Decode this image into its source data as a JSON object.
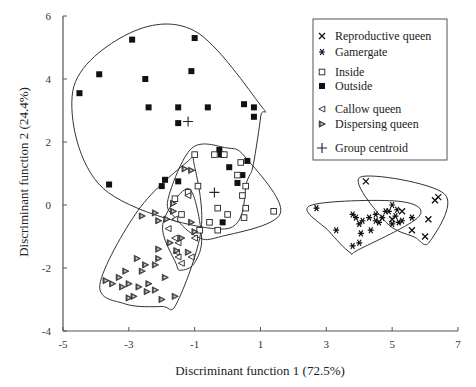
{
  "chart_data": {
    "type": "scatter",
    "title": "",
    "xlabel": "Discriminant function 1 (72.5%)",
    "ylabel": "Discriminant function 2 (24.4%)",
    "xlim": [
      -5,
      7
    ],
    "ylim": [
      -4,
      6
    ],
    "xticks": [
      -5,
      -3,
      -1,
      1,
      3,
      5,
      7
    ],
    "yticks": [
      -4,
      -2,
      0,
      2,
      4,
      6
    ],
    "grid": false,
    "legend_position": "upper right",
    "legend": [
      {
        "name": "Reproductive queen",
        "marker": "x"
      },
      {
        "name": "Gamergate",
        "marker": "asterisk"
      },
      {
        "name": "Inside",
        "marker": "open-square"
      },
      {
        "name": "Outside",
        "marker": "filled-square"
      },
      {
        "name": "Callow queen",
        "marker": "open-left-triangle"
      },
      {
        "name": "Dispersing queen",
        "marker": "filled-right-triangle"
      },
      {
        "name": "Group centroid",
        "marker": "plus"
      }
    ],
    "series": [
      {
        "name": "Outside",
        "points": [
          [
            -4.5,
            3.55
          ],
          [
            -3.9,
            4.15
          ],
          [
            -2.9,
            5.25
          ],
          [
            -2.5,
            4.0
          ],
          [
            -2.4,
            3.1
          ],
          [
            -1.5,
            3.1
          ],
          [
            -1.0,
            5.3
          ],
          [
            -1.1,
            4.25
          ],
          [
            -0.6,
            3.1
          ],
          [
            0.5,
            3.2
          ],
          [
            0.8,
            3.1
          ],
          [
            0.8,
            2.8
          ],
          [
            -1.5,
            2.6
          ],
          [
            -3.6,
            0.65
          ],
          [
            -2.0,
            0.6
          ],
          [
            -1.9,
            0.8
          ],
          [
            -1.5,
            0.75
          ],
          [
            -0.2,
            1.6
          ],
          [
            -0.25,
            1.75
          ],
          [
            0.05,
            1.2
          ],
          [
            0.45,
            0.95
          ],
          [
            0.6,
            1.4
          ],
          [
            0.3,
            0.7
          ],
          [
            -0.15,
            -0.55
          ]
        ],
        "centroid": [
          -1.2,
          2.65
        ]
      },
      {
        "name": "Inside",
        "points": [
          [
            -1.0,
            1.6
          ],
          [
            -0.4,
            1.6
          ],
          [
            -0.1,
            1.6
          ],
          [
            0.4,
            1.35
          ],
          [
            0.3,
            0.95
          ],
          [
            0.55,
            0.6
          ],
          [
            -0.9,
            0.6
          ],
          [
            -1.2,
            0.4
          ],
          [
            0.45,
            0.3
          ],
          [
            -1.6,
            0.2
          ],
          [
            -0.3,
            -0.1
          ],
          [
            -0.0,
            -0.3
          ],
          [
            0.55,
            -0.1
          ],
          [
            0.5,
            -0.4
          ],
          [
            1.4,
            -0.2
          ],
          [
            -0.55,
            -0.55
          ],
          [
            -0.85,
            -0.8
          ],
          [
            -0.3,
            -0.8
          ],
          [
            -1.4,
            -0.3
          ]
        ],
        "centroid": [
          -0.4,
          0.4
        ]
      },
      {
        "name": "Callow queen",
        "points": [
          [
            -1.2,
            0.3
          ],
          [
            -1.6,
            -0.45
          ],
          [
            -1.8,
            -0.75
          ],
          [
            -1.0,
            -1.05
          ],
          [
            -1.5,
            -1.2
          ],
          [
            -1.55,
            -1.5
          ],
          [
            -1.6,
            -1.05
          ],
          [
            -1.1,
            -1.65
          ],
          [
            -1.4,
            -1.85
          ],
          [
            -1.5,
            -1.65
          ]
        ],
        "centroid": [
          -1.35,
          -1.0
        ]
      },
      {
        "name": "Dispersing queen",
        "points": [
          [
            -1.1,
            1.1
          ],
          [
            -1.3,
            1.15
          ],
          [
            -1.65,
            0.05
          ],
          [
            -1.65,
            -0.2
          ],
          [
            -2.1,
            -0.5
          ],
          [
            -1.85,
            -0.45
          ],
          [
            -1.1,
            -0.55
          ],
          [
            -1.0,
            -0.85
          ],
          [
            -1.4,
            -1.05
          ],
          [
            -1.55,
            -1.45
          ],
          [
            -1.75,
            -1.2
          ],
          [
            -2.1,
            -1.4
          ],
          [
            -1.2,
            -1.5
          ],
          [
            -2.6,
            -0.35
          ],
          [
            -2.2,
            -0.25
          ],
          [
            -2.75,
            -1.7
          ],
          [
            -2.1,
            -1.7
          ],
          [
            -2.2,
            -1.9
          ],
          [
            -2.5,
            -1.9
          ],
          [
            -3.1,
            -2.1
          ],
          [
            -2.6,
            -2.1
          ],
          [
            -2.4,
            -2.5
          ],
          [
            -1.9,
            -2.3
          ],
          [
            -3.3,
            -2.3
          ],
          [
            -3.5,
            -2.5
          ],
          [
            -3.0,
            -2.5
          ],
          [
            -2.7,
            -2.6
          ],
          [
            -2.45,
            -2.75
          ],
          [
            -2.85,
            -2.9
          ],
          [
            -3.2,
            -2.6
          ],
          [
            -3.7,
            -2.4
          ],
          [
            -2.2,
            -2.7
          ],
          [
            -1.6,
            -2.9
          ],
          [
            -2.0,
            -3.0
          ],
          [
            -3.0,
            -2.95
          ]
        ],
        "centroid": [
          -2.55,
          -2.1
        ]
      },
      {
        "name": "Gamergate",
        "points": [
          [
            2.7,
            -0.1
          ],
          [
            3.3,
            -0.8
          ],
          [
            3.8,
            -0.3
          ],
          [
            3.9,
            -0.4
          ],
          [
            4.0,
            -0.6
          ],
          [
            4.05,
            -0.9
          ],
          [
            4.1,
            -0.5
          ],
          [
            4.0,
            -1.2
          ],
          [
            3.8,
            -1.3
          ],
          [
            4.3,
            -0.4
          ],
          [
            4.5,
            -0.5
          ],
          [
            4.5,
            -0.3
          ],
          [
            4.7,
            -0.4
          ],
          [
            4.9,
            -0.2
          ],
          [
            5.0,
            -0.6
          ],
          [
            5.1,
            -0.35
          ],
          [
            5.2,
            -0.55
          ],
          [
            5.3,
            -0.5
          ],
          [
            5.6,
            -0.4
          ],
          [
            4.8,
            -0.2
          ],
          [
            5.15,
            -0.15
          ],
          [
            4.6,
            -0.55
          ],
          [
            4.35,
            -0.8
          ],
          [
            5.0,
            0.0
          ]
        ],
        "centroid": [
          4.6,
          -0.5
        ]
      },
      {
        "name": "Reproductive queen",
        "points": [
          [
            4.2,
            0.75
          ],
          [
            5.0,
            -0.45
          ],
          [
            5.3,
            -0.2
          ],
          [
            5.6,
            -0.8
          ],
          [
            6.0,
            -1.0
          ],
          [
            6.1,
            -0.45
          ],
          [
            6.3,
            0.15
          ],
          [
            6.4,
            0.25
          ]
        ],
        "centroid": [
          5.3,
          0.1
        ]
      }
    ]
  }
}
